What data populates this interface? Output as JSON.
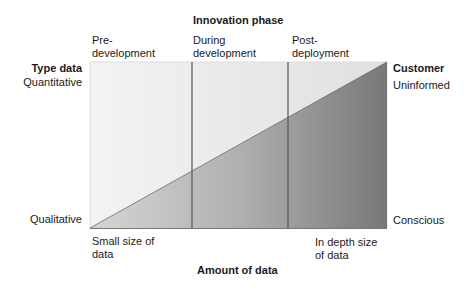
{
  "top_heading": "Innovation phase",
  "phases": [
    {
      "label": "Pre-\ndevelopment"
    },
    {
      "label": "During\ndevelopment"
    },
    {
      "label": "Post-\ndeployment"
    }
  ],
  "left_axis": {
    "title": "Type data",
    "top_label": "Quantitative",
    "bottom_label": "Qualitative"
  },
  "right_axis": {
    "title": "Customer",
    "top_label": "Uninformed",
    "bottom_label": "Conscious"
  },
  "bottom_axis": {
    "title": "Amount of data",
    "left_label": "Small size of\ndata",
    "right_label": "In depth size\nof data"
  },
  "colors": {
    "upper_light": "#f2f2f2",
    "upper_right": "#e2e2e2",
    "lower_left": "#d0d0d0",
    "lower_right": "#7a7a7a",
    "divider": "#555555"
  }
}
